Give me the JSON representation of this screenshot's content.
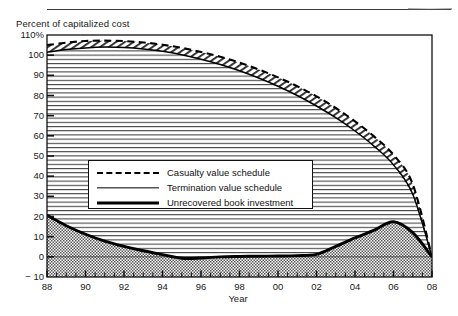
{
  "figure": {
    "y_axis_title": "Percent of capitalized cost",
    "x_axis_title": "Year"
  },
  "legend": {
    "items": [
      {
        "label": "Casualty value schedule",
        "style": "dashed"
      },
      {
        "label": "Termination value schedule",
        "style": "thin-solid"
      },
      {
        "label": "Unrecovered book investment",
        "style": "thick-solid"
      }
    ]
  },
  "chart_data": {
    "type": "line",
    "title": "",
    "xlabel": "Year",
    "ylabel": "Percent of capitalized cost",
    "xlim": [
      1988,
      2008
    ],
    "ylim": [
      -10,
      110
    ],
    "ytick_labels": [
      "110%",
      "100",
      "90",
      "80",
      "70",
      "60",
      "50",
      "40",
      "30",
      "20",
      "10",
      "0",
      "− 10"
    ],
    "ytick_values": [
      110,
      100,
      90,
      80,
      70,
      60,
      50,
      40,
      30,
      20,
      10,
      0,
      -10
    ],
    "xtick_labels": [
      "88",
      "90",
      "92",
      "94",
      "96",
      "98",
      "00",
      "02",
      "04",
      "06",
      "08"
    ],
    "xtick_values": [
      1988,
      1990,
      1992,
      1994,
      1996,
      1998,
      2000,
      2002,
      2004,
      2006,
      2008
    ],
    "minor_tick_interval": 0.5,
    "grid": false,
    "x": [
      1988,
      1989,
      1990,
      1991,
      1992,
      1993,
      1994,
      1995,
      1996,
      1997,
      1998,
      1999,
      2000,
      2001,
      2002,
      2003,
      2004,
      2005,
      2006,
      2007,
      2008
    ],
    "series": [
      {
        "name": "Casualty value schedule",
        "style": "dashed",
        "values": [
          105.0,
          106.2,
          107.0,
          107.2,
          107.0,
          106.3,
          105.2,
          103.6,
          101.6,
          99.2,
          96.3,
          92.9,
          89.0,
          84.6,
          79.6,
          73.8,
          67.2,
          59.6,
          50.6,
          36.0,
          0.0
        ]
      },
      {
        "name": "Termination value schedule",
        "style": "thin-solid",
        "values": [
          101.5,
          102.8,
          103.6,
          104.0,
          103.8,
          103.1,
          101.9,
          100.2,
          98.0,
          95.4,
          92.3,
          88.7,
          84.6,
          80.0,
          74.8,
          69.0,
          62.4,
          54.8,
          45.6,
          31.0,
          0.0
        ]
      },
      {
        "name": "Unrecovered book investment",
        "style": "thick-solid",
        "values": [
          20.6,
          15.4,
          11.2,
          7.8,
          5.2,
          3.0,
          1.1,
          -0.7,
          -0.6,
          0.0,
          0.2,
          0.3,
          0.4,
          0.6,
          1.2,
          5.2,
          9.4,
          13.2,
          17.4,
          12.0,
          0.0
        ]
      }
    ],
    "fill_between": {
      "upper": "Casualty value schedule",
      "lower": "Termination value schedule",
      "pattern": "diagonal-hatch"
    },
    "fill_under": {
      "series": "Termination value schedule",
      "pattern": "horizontal-lines"
    },
    "fill_under_book": {
      "series": "Unrecovered book investment",
      "pattern": "dotted-stipple"
    }
  }
}
